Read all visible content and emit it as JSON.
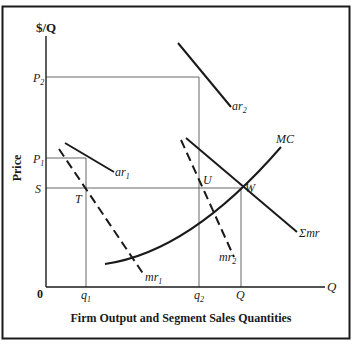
{
  "diagram": {
    "title": "Firm Output and Segment Sales Quantities",
    "y_axis_label": "$/Q",
    "y_axis_side_label": "Price",
    "x_axis_label": "Q",
    "origin_label": "0",
    "y_ticks": {
      "p2": "P",
      "p2_sub": "2",
      "p1": "P",
      "p1_sub": "1",
      "s": "S"
    },
    "x_ticks": {
      "q1": "q",
      "q1_sub": "1",
      "q2": "q",
      "q2_sub": "2",
      "Q": "Q"
    },
    "curves": {
      "ar2": {
        "name": "ar",
        "sub": "2"
      },
      "ar1": {
        "name": "ar",
        "sub": "1"
      },
      "mr1": {
        "name": "mr",
        "sub": "1"
      },
      "mr2": {
        "name": "mr",
        "sub": "2"
      },
      "sum_mr": {
        "name": "Σmr"
      },
      "mc": {
        "name": "MC"
      }
    },
    "points": {
      "T": "T",
      "U": "U",
      "W": "W"
    },
    "colors": {
      "line": "#1a1a1a",
      "guide": "#555555",
      "background": "#ffffff"
    }
  }
}
